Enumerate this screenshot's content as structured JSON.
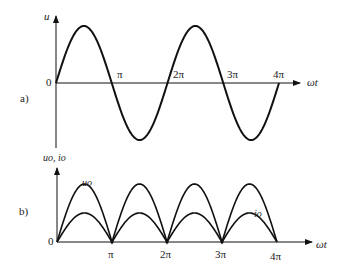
{
  "panel_a": {
    "label": "a)",
    "y_axis_label": "u",
    "x_axis_label": "ωt",
    "origin_label": "0",
    "ticks": [
      "π",
      "2π",
      "3π",
      "4π"
    ],
    "curve": "sine u over 0..4π (two full cycles)"
  },
  "panel_b": {
    "label": "b)",
    "y_axis_label": "uo, io",
    "x_axis_label": "ωt",
    "origin_label": "0",
    "ticks": [
      "π",
      "2π",
      "3π",
      "4π"
    ],
    "curve_labels": {
      "u": "uo",
      "i": "io"
    },
    "curve": "full-wave rectified |sin|, uo larger amplitude, io smaller amplitude"
  },
  "colors": {
    "line": "#111111",
    "background": "#ffffff"
  }
}
